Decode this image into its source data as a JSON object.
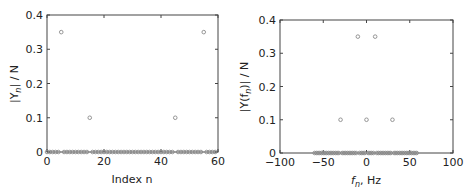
{
  "chart_data": [
    {
      "type": "scatter",
      "title": "",
      "xlabel": "Index n",
      "ylabel": "|Y_n| / N",
      "xlim": [
        0,
        60
      ],
      "ylim": [
        0,
        0.4
      ],
      "xticks": [
        0,
        20,
        40,
        60
      ],
      "xtick_labels": [
        "0",
        "20",
        "40",
        "60"
      ],
      "yticks": [
        0,
        0.1,
        0.2,
        0.3,
        0.4
      ],
      "ytick_labels": [
        "0",
        "0.1",
        "0.2",
        "0.3",
        "0.4"
      ],
      "grid": false,
      "legend": null,
      "marker": "open-circle",
      "x_range": {
        "start": 0,
        "stop": 59,
        "step": 1
      },
      "default_value": 0,
      "nonzero_points": [
        {
          "x": 5,
          "y": 0.35
        },
        {
          "x": 15,
          "y": 0.1
        },
        {
          "x": 45,
          "y": 0.1
        },
        {
          "x": 55,
          "y": 0.35
        }
      ]
    },
    {
      "type": "scatter",
      "title": "",
      "xlabel": "f_n, Hz",
      "ylabel": "|Y(f_n)| / N",
      "xlim": [
        -100,
        100
      ],
      "ylim": [
        0,
        0.4
      ],
      "xticks": [
        -100,
        -50,
        0,
        50,
        100
      ],
      "xtick_labels": [
        "−100",
        "−50",
        "0",
        "50",
        "100"
      ],
      "yticks": [
        0,
        0.1,
        0.2,
        0.3,
        0.4
      ],
      "ytick_labels": [
        "0",
        "0.1",
        "0.2",
        "0.3",
        "0.4"
      ],
      "grid": false,
      "legend": null,
      "marker": "open-circle",
      "x_range": {
        "start": -60,
        "stop": 58,
        "step": 2
      },
      "default_value": 0,
      "nonzero_points": [
        {
          "x": -30,
          "y": 0.1
        },
        {
          "x": -10,
          "y": 0.35
        },
        {
          "x": 0,
          "y": 0.1
        },
        {
          "x": 10,
          "y": 0.35
        },
        {
          "x": 30,
          "y": 0.1
        }
      ]
    }
  ],
  "labels": {
    "left_xlabel": "Index n",
    "left_ylabel_pre": "|Y",
    "left_ylabel_sub": "n",
    "left_ylabel_post": "| / N",
    "right_xlabel_f": "f",
    "right_xlabel_sub": "n",
    "right_xlabel_post": ", Hz",
    "right_ylabel_pre": "|Y(f",
    "right_ylabel_sub": "n",
    "right_ylabel_post": ")| / N"
  }
}
